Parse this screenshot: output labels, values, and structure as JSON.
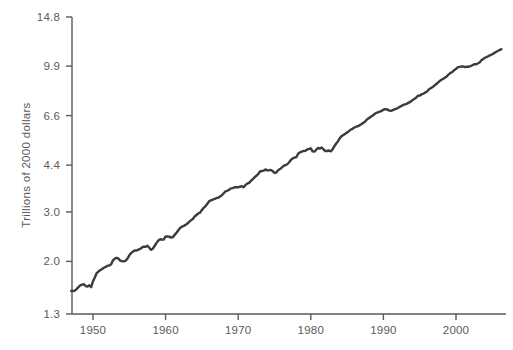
{
  "chart_data": {
    "type": "line",
    "title": "",
    "subtitle": "",
    "xlabel": "",
    "ylabel": "Trillions of 2000 dollars",
    "yscale": "log",
    "xscale": "linear",
    "grid": false,
    "legend": null,
    "legend_position": "none",
    "series_name": "Real GDP",
    "line_color": "#3b3b3b",
    "axis_color": "#5a5a5a",
    "background_color": "#ffffff",
    "xlim": [
      1947.0,
      2006.5
    ],
    "ylim": [
      1.3,
      14.8
    ],
    "xticks": [
      1950,
      1960,
      1970,
      1980,
      1990,
      2000
    ],
    "xticklabels": [
      "1950",
      "1960",
      "1970",
      "1980",
      "1990",
      "2000"
    ],
    "yticks": [
      1.3,
      2.0,
      3.0,
      4.4,
      6.6,
      9.9,
      14.8
    ],
    "yticklabels": [
      "1.3",
      "2.0",
      "3.0",
      "4.4",
      "6.6",
      "9.9",
      "14.8"
    ],
    "x": [
      1947.0,
      1947.25,
      1947.5,
      1947.75,
      1948.0,
      1948.25,
      1948.5,
      1948.75,
      1949.0,
      1949.25,
      1949.5,
      1949.75,
      1950.0,
      1950.25,
      1950.5,
      1950.75,
      1951.0,
      1951.25,
      1951.5,
      1951.75,
      1952.0,
      1952.25,
      1952.5,
      1952.75,
      1953.0,
      1953.25,
      1953.5,
      1953.75,
      1954.0,
      1954.25,
      1954.5,
      1954.75,
      1955.0,
      1955.25,
      1955.5,
      1955.75,
      1956.0,
      1956.25,
      1956.5,
      1956.75,
      1957.0,
      1957.25,
      1957.5,
      1957.75,
      1958.0,
      1958.25,
      1958.5,
      1958.75,
      1959.0,
      1959.25,
      1959.5,
      1959.75,
      1960.0,
      1960.25,
      1960.5,
      1960.75,
      1961.0,
      1961.25,
      1961.5,
      1961.75,
      1962.0,
      1962.25,
      1962.5,
      1962.75,
      1963.0,
      1963.25,
      1963.5,
      1963.75,
      1964.0,
      1964.25,
      1964.5,
      1964.75,
      1965.0,
      1965.25,
      1965.5,
      1965.75,
      1966.0,
      1966.25,
      1966.5,
      1966.75,
      1967.0,
      1967.25,
      1967.5,
      1967.75,
      1968.0,
      1968.25,
      1968.5,
      1968.75,
      1969.0,
      1969.25,
      1969.5,
      1969.75,
      1970.0,
      1970.25,
      1970.5,
      1970.75,
      1971.0,
      1971.25,
      1971.5,
      1971.75,
      1972.0,
      1972.25,
      1972.5,
      1972.75,
      1973.0,
      1973.25,
      1973.5,
      1973.75,
      1974.0,
      1974.25,
      1974.5,
      1974.75,
      1975.0,
      1975.25,
      1975.5,
      1975.75,
      1976.0,
      1976.25,
      1976.5,
      1976.75,
      1977.0,
      1977.25,
      1977.5,
      1977.75,
      1978.0,
      1978.25,
      1978.5,
      1978.75,
      1979.0,
      1979.25,
      1979.5,
      1979.75,
      1980.0,
      1980.25,
      1980.5,
      1980.75,
      1981.0,
      1981.25,
      1981.5,
      1981.75,
      1982.0,
      1982.25,
      1982.5,
      1982.75,
      1983.0,
      1983.25,
      1983.5,
      1983.75,
      1984.0,
      1984.25,
      1984.5,
      1984.75,
      1985.0,
      1985.25,
      1985.5,
      1985.75,
      1986.0,
      1986.25,
      1986.5,
      1986.75,
      1987.0,
      1987.25,
      1987.5,
      1987.75,
      1988.0,
      1988.25,
      1988.5,
      1988.75,
      1989.0,
      1989.25,
      1989.5,
      1989.75,
      1990.0,
      1990.25,
      1990.5,
      1990.75,
      1991.0,
      1991.25,
      1991.5,
      1991.75,
      1992.0,
      1992.25,
      1992.5,
      1992.75,
      1993.0,
      1993.25,
      1993.5,
      1993.75,
      1994.0,
      1994.25,
      1994.5,
      1994.75,
      1995.0,
      1995.25,
      1995.5,
      1995.75,
      1996.0,
      1996.25,
      1996.5,
      1996.75,
      1997.0,
      1997.25,
      1997.5,
      1997.75,
      1998.0,
      1998.25,
      1998.5,
      1998.75,
      1999.0,
      1999.25,
      1999.5,
      1999.75,
      2000.0,
      2000.25,
      2000.5,
      2000.75,
      2001.0,
      2001.25,
      2001.5,
      2001.75,
      2002.0,
      2002.25,
      2002.5,
      2002.75,
      2003.0,
      2003.25,
      2003.5,
      2003.75,
      2004.0,
      2004.25,
      2004.5,
      2004.75,
      2005.0,
      2005.25,
      2005.5,
      2005.75,
      2006.0,
      2006.25
    ],
    "y": [
      1.571,
      1.569,
      1.574,
      1.594,
      1.621,
      1.644,
      1.654,
      1.658,
      1.634,
      1.628,
      1.646,
      1.619,
      1.7,
      1.753,
      1.816,
      1.84,
      1.864,
      1.878,
      1.899,
      1.912,
      1.93,
      1.935,
      1.954,
      2.017,
      2.046,
      2.061,
      2.046,
      2.013,
      2.003,
      2.0,
      2.012,
      2.047,
      2.102,
      2.141,
      2.168,
      2.188,
      2.186,
      2.203,
      2.215,
      2.242,
      2.255,
      2.254,
      2.275,
      2.236,
      2.198,
      2.222,
      2.273,
      2.327,
      2.374,
      2.397,
      2.391,
      2.394,
      2.453,
      2.453,
      2.45,
      2.43,
      2.44,
      2.485,
      2.53,
      2.582,
      2.628,
      2.659,
      2.676,
      2.697,
      2.728,
      2.765,
      2.804,
      2.831,
      2.889,
      2.924,
      2.96,
      2.981,
      3.049,
      3.103,
      3.146,
      3.207,
      3.275,
      3.297,
      3.318,
      3.335,
      3.362,
      3.369,
      3.405,
      3.439,
      3.495,
      3.547,
      3.567,
      3.597,
      3.637,
      3.646,
      3.672,
      3.67,
      3.666,
      3.686,
      3.702,
      3.671,
      3.741,
      3.782,
      3.804,
      3.867,
      3.92,
      3.979,
      4.033,
      4.088,
      4.176,
      4.192,
      4.205,
      4.247,
      4.215,
      4.22,
      4.23,
      4.189,
      4.125,
      4.145,
      4.22,
      4.259,
      4.31,
      4.37,
      4.396,
      4.431,
      4.495,
      4.591,
      4.644,
      4.683,
      4.691,
      4.83,
      4.886,
      4.918,
      4.942,
      4.951,
      5.0,
      5.024,
      5.05,
      4.923,
      4.913,
      4.991,
      5.068,
      5.038,
      5.084,
      5.007,
      4.94,
      4.939,
      4.959,
      4.926,
      5.003,
      5.137,
      5.251,
      5.354,
      5.491,
      5.581,
      5.634,
      5.687,
      5.75,
      5.811,
      5.886,
      5.923,
      5.987,
      6.025,
      6.059,
      6.103,
      6.162,
      6.227,
      6.294,
      6.403,
      6.457,
      6.539,
      6.593,
      6.675,
      6.749,
      6.782,
      6.814,
      6.857,
      6.93,
      6.955,
      6.948,
      6.892,
      6.859,
      6.895,
      6.948,
      6.972,
      7.023,
      7.09,
      7.144,
      7.216,
      7.236,
      7.278,
      7.338,
      7.4,
      7.479,
      7.568,
      7.642,
      7.763,
      7.773,
      7.848,
      7.894,
      7.969,
      8.037,
      8.173,
      8.253,
      8.323,
      8.436,
      8.537,
      8.641,
      8.756,
      8.846,
      8.93,
      9.006,
      9.114,
      9.248,
      9.362,
      9.435,
      9.58,
      9.669,
      9.807,
      9.836,
      9.868,
      9.875,
      9.82,
      9.85,
      9.85,
      9.9,
      9.97,
      10.053,
      10.046,
      10.114,
      10.195,
      10.383,
      10.49,
      10.6,
      10.669,
      10.76,
      10.83,
      10.91,
      11.01,
      11.11,
      11.2,
      11.29,
      11.37
    ],
    "recession_dips": [
      {
        "label": "1949 recession",
        "start": 1948.75,
        "end": 1949.75
      },
      {
        "label": "1953-54 recession",
        "start": 1953.25,
        "end": 1954.25
      },
      {
        "label": "1957-58 recession",
        "start": 1957.5,
        "end": 1958.0
      },
      {
        "label": "1960-61 recession",
        "start": 1960.0,
        "end": 1961.0
      },
      {
        "label": "1970 recession",
        "start": 1969.75,
        "end": 1970.75
      },
      {
        "label": "1973-75 recession",
        "start": 1973.75,
        "end": 1975.0
      },
      {
        "label": "1980 recession",
        "start": 1980.0,
        "end": 1980.5
      },
      {
        "label": "1981-82 recession",
        "start": 1981.25,
        "end": 1982.75
      },
      {
        "label": "1990-91 recession",
        "start": 1990.0,
        "end": 1991.0
      },
      {
        "label": "2001 recession",
        "start": 2000.75,
        "end": 2001.75
      }
    ]
  },
  "figure": {
    "accent_color": "#3b3b3b",
    "axis_color": "#5a5a5a",
    "label_color": "#5a5a5a",
    "background_color": "#ffffff"
  }
}
